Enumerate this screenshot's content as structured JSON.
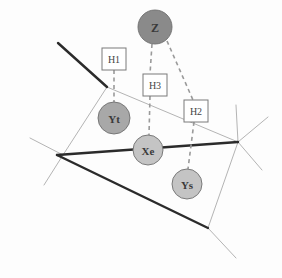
{
  "figure": {
    "width": 282,
    "height": 278,
    "background": "#fdfdfd"
  },
  "colors": {
    "node_dark": "#8a8a8a",
    "node_mid": "#a8a8a8",
    "node_light": "#c4c4c4",
    "node_stroke": "#6f6f6f",
    "thick_edge": "#2b2b2b",
    "thin_edge": "#b4b4b4",
    "dashed_edge": "#9a9a9a",
    "box_fill": "#ffffff",
    "box_stroke": "#7a7a7a",
    "text": "#3a3a3a"
  },
  "nodes": [
    {
      "id": "Z",
      "label": "Z",
      "cx": 155,
      "cy": 27,
      "r": 17,
      "fill": "#8a8a8a",
      "font_size": 12
    },
    {
      "id": "Yt",
      "label": "Yt",
      "cx": 114,
      "cy": 118,
      "r": 16,
      "fill": "#a8a8a8",
      "font_size": 11
    },
    {
      "id": "Xe",
      "label": "Xe",
      "cx": 148,
      "cy": 150,
      "r": 15,
      "fill": "#c4c4c4",
      "font_size": 11
    },
    {
      "id": "Ys",
      "label": "Ys",
      "cx": 187,
      "cy": 184,
      "r": 15,
      "fill": "#c4c4c4",
      "font_size": 11
    }
  ],
  "hypothesis_boxes": [
    {
      "id": "H1",
      "label": "H1",
      "x": 102,
      "y": 48,
      "w": 24,
      "h": 22,
      "font_size": 10
    },
    {
      "id": "H3",
      "label": "H3",
      "x": 143,
      "y": 74,
      "w": 24,
      "h": 22,
      "font_size": 10
    },
    {
      "id": "H2",
      "label": "H2",
      "x": 184,
      "y": 100,
      "w": 24,
      "h": 22,
      "font_size": 10
    }
  ],
  "dashed_links": [
    {
      "id": "z-to-h3",
      "from": "Z",
      "to": "H3",
      "points": "152,44 150,74"
    },
    {
      "id": "z-to-h2",
      "from": "Z",
      "to": "H2",
      "points": "167,41 193,100"
    },
    {
      "id": "h1-to-yt",
      "from": "H1",
      "to": "Yt",
      "points": "114,70 114,102"
    },
    {
      "id": "h3-to-xe",
      "from": "H3",
      "to": "Xe",
      "points": "150,96 149,135"
    },
    {
      "id": "h2-to-ys",
      "from": "H2",
      "to": "Ys",
      "points": "194,122 188,169"
    }
  ],
  "thick_edges": [
    {
      "id": "edge-upper-left",
      "points": "58,43 107,87"
    },
    {
      "id": "edge-mid-horizontal",
      "points": "57,155 238,142"
    },
    {
      "id": "edge-lower-diagonal",
      "points": "57,155 208,228"
    }
  ],
  "thin_edges": [
    {
      "id": "cell-left-upper",
      "points": "107,87 63,155"
    },
    {
      "id": "cell-left-spur",
      "points": "30,138 63,155"
    },
    {
      "id": "cell-left-down",
      "points": "63,155 44,185"
    },
    {
      "id": "cell-diagonal",
      "points": "107,87 238,142"
    },
    {
      "id": "cell-right-up",
      "points": "238,142 236,105"
    },
    {
      "id": "cell-right-out",
      "points": "238,142 268,117"
    },
    {
      "id": "cell-right-low",
      "points": "238,142 262,170"
    },
    {
      "id": "cell-right-down",
      "points": "238,142 208,228"
    },
    {
      "id": "cell-bottom-out",
      "points": "208,228 236,258"
    }
  ],
  "legend": {
    "node_types": [
      "Z",
      "Yt",
      "Xe",
      "Ys"
    ],
    "hypothesis_labels": [
      "H1",
      "H2",
      "H3"
    ]
  }
}
